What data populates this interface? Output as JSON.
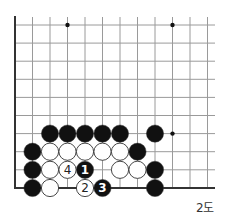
{
  "diagram": {
    "caption": "2도",
    "grid": {
      "cols_x": [
        15,
        32.5,
        50,
        67.5,
        85,
        102.5,
        120,
        137.5,
        155,
        172.5,
        190,
        207.5
      ],
      "rows_y": [
        25,
        43.1,
        61.2,
        79.3,
        97.4,
        115.5,
        133.6,
        151.7,
        169.8,
        188
      ],
      "right_edge_x": 215,
      "top_extent_y": 17,
      "left_edge_thick": true,
      "bottom_edge_thick": true
    },
    "star_points": [
      {
        "col": 3,
        "row": 0
      },
      {
        "col": 9,
        "row": 0
      },
      {
        "col": 9,
        "row": 6
      }
    ],
    "stones": [
      {
        "color": "black",
        "col": 2,
        "row": 6
      },
      {
        "color": "black",
        "col": 3,
        "row": 6
      },
      {
        "color": "black",
        "col": 4,
        "row": 6
      },
      {
        "color": "black",
        "col": 5,
        "row": 6
      },
      {
        "color": "black",
        "col": 6,
        "row": 6
      },
      {
        "color": "black",
        "col": 8,
        "row": 6
      },
      {
        "color": "black",
        "col": 1,
        "row": 7
      },
      {
        "color": "white",
        "col": 2,
        "row": 7
      },
      {
        "color": "white",
        "col": 3,
        "row": 7
      },
      {
        "color": "white",
        "col": 4,
        "row": 7
      },
      {
        "color": "white",
        "col": 5,
        "row": 7
      },
      {
        "color": "white",
        "col": 6,
        "row": 7
      },
      {
        "color": "black",
        "col": 7,
        "row": 7
      },
      {
        "color": "black",
        "col": 1,
        "row": 8
      },
      {
        "color": "white",
        "col": 2,
        "row": 8
      },
      {
        "color": "white",
        "col": 3,
        "row": 8,
        "label": "4"
      },
      {
        "color": "black",
        "col": 4,
        "row": 8,
        "label": "1"
      },
      {
        "color": "white",
        "col": 6,
        "row": 8
      },
      {
        "color": "white",
        "col": 7,
        "row": 8
      },
      {
        "color": "black",
        "col": 8,
        "row": 8
      },
      {
        "color": "black",
        "col": 1,
        "row": 9
      },
      {
        "color": "white",
        "col": 2,
        "row": 9
      },
      {
        "color": "white",
        "col": 4,
        "row": 9,
        "label": "2"
      },
      {
        "color": "black",
        "col": 5,
        "row": 9,
        "label": "3"
      },
      {
        "color": "black",
        "col": 8,
        "row": 9
      }
    ],
    "colors": {
      "line": "#9a9a9a",
      "edge": "#333333",
      "black_stone": "#111111",
      "white_stone": "#ffffff",
      "stone_outline": "#333333"
    }
  }
}
